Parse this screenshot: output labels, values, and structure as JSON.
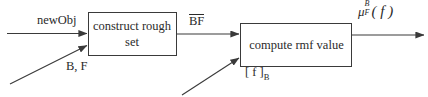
{
  "diagram": {
    "type": "block-flow-diagram",
    "background_color": "#ffffff",
    "line_color": "#3a3a3a",
    "text_color": "#2b2b2b",
    "blocks": [
      {
        "id": "construct-rough-set",
        "line1": "construct rough",
        "line2": "set",
        "x": 88,
        "y": 12,
        "width": 88,
        "height": 44
      },
      {
        "id": "compute-rmf-value",
        "line1": "compute rmf value",
        "x": 240,
        "y": 23,
        "width": 112,
        "height": 44
      }
    ],
    "labels": {
      "new_object_input": "newObj",
      "b_f_input": "B, F",
      "bf_bar": "BF",
      "bf_bar_has_overline": true,
      "f_bracket_b": "[ f ]",
      "f_bracket_b_subscript": "B",
      "mu_symbol": "μ",
      "mu_superscript": "B",
      "mu_subscript": "F",
      "mu_argument": "( f )"
    },
    "edges": [
      {
        "id": "newobj-to-box1",
        "label": "newObj",
        "from": "external",
        "to": "construct-rough-set",
        "style": "horizontal-arrow"
      },
      {
        "id": "bf-to-box1",
        "label": "B, F",
        "from": "external",
        "to": "construct-rough-set",
        "style": "diagonal-arrow"
      },
      {
        "id": "box1-to-box2",
        "label": "BF",
        "from": "construct-rough-set",
        "to": "compute-rmf-value",
        "style": "horizontal-arrow"
      },
      {
        "id": "fb-to-box2",
        "label": "[ f ]B",
        "from": "external",
        "to": "compute-rmf-value",
        "style": "diagonal-arrow"
      },
      {
        "id": "box2-to-output",
        "label": "μ_F^B ( f )",
        "from": "compute-rmf-value",
        "to": "external",
        "style": "horizontal-arrow"
      }
    ]
  }
}
